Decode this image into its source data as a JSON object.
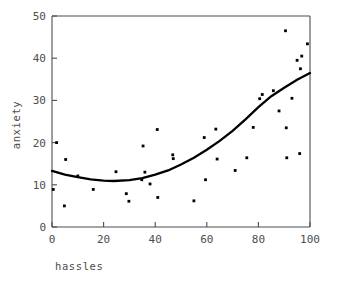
{
  "figure": {
    "background_color": "#ffffff",
    "axis_color": "#4d4d4d",
    "curve_color": "#000000",
    "point_color": "#000000"
  },
  "axes": {
    "x_title": "hassles",
    "y_title": "anxiety",
    "x_ticks": [
      "0",
      "20",
      "40",
      "60",
      "80",
      "100"
    ],
    "y_ticks": [
      "0",
      "10",
      "20",
      "30",
      "40",
      "50"
    ]
  },
  "chart_data": {
    "type": "scatter",
    "title": "",
    "xlabel": "hassles",
    "ylabel": "anxiety",
    "xlim": [
      0,
      100
    ],
    "ylim": [
      0,
      50
    ],
    "xticks": [
      0,
      20,
      40,
      60,
      80,
      100
    ],
    "yticks": [
      0,
      10,
      20,
      30,
      40,
      50
    ],
    "grid": false,
    "legend": "none",
    "series": [
      {
        "name": "observations",
        "type": "scatter",
        "marker": "square",
        "points": [
          [
            0.5,
            8.9
          ],
          [
            1.8,
            20.0
          ],
          [
            4.8,
            5.0
          ],
          [
            5.3,
            16.0
          ],
          [
            10.0,
            12.1
          ],
          [
            16.0,
            8.9
          ],
          [
            24.8,
            13.1
          ],
          [
            28.8,
            7.9
          ],
          [
            29.8,
            6.1
          ],
          [
            34.8,
            11.2
          ],
          [
            35.3,
            19.2
          ],
          [
            36.0,
            13.0
          ],
          [
            38.0,
            10.2
          ],
          [
            40.8,
            23.1
          ],
          [
            41.0,
            7.0
          ],
          [
            46.8,
            17.1
          ],
          [
            47.0,
            16.2
          ],
          [
            55.0,
            6.2
          ],
          [
            59.0,
            21.2
          ],
          [
            59.5,
            11.2
          ],
          [
            63.5,
            23.2
          ],
          [
            64.0,
            16.1
          ],
          [
            71.0,
            13.4
          ],
          [
            75.5,
            16.4
          ],
          [
            78.0,
            23.6
          ],
          [
            80.5,
            30.4
          ],
          [
            81.5,
            31.4
          ],
          [
            85.8,
            32.3
          ],
          [
            88.0,
            27.5
          ],
          [
            90.5,
            46.5
          ],
          [
            90.8,
            23.5
          ],
          [
            91.0,
            16.4
          ],
          [
            93.0,
            30.5
          ],
          [
            95.0,
            39.5
          ],
          [
            96.0,
            17.4
          ],
          [
            96.3,
            37.5
          ],
          [
            96.8,
            40.5
          ],
          [
            99.0,
            43.4
          ]
        ]
      },
      {
        "name": "quadratic fit",
        "type": "line",
        "curve_points": [
          [
            0,
            13.3
          ],
          [
            5,
            12.4
          ],
          [
            10,
            11.8
          ],
          [
            15,
            11.3
          ],
          [
            20,
            11.0
          ],
          [
            24,
            10.9
          ],
          [
            30,
            11.1
          ],
          [
            35,
            11.6
          ],
          [
            40,
            12.4
          ],
          [
            45,
            13.4
          ],
          [
            50,
            14.8
          ],
          [
            55,
            16.4
          ],
          [
            60,
            18.3
          ],
          [
            65,
            20.4
          ],
          [
            70,
            22.8
          ],
          [
            75,
            25.5
          ],
          [
            80,
            28.4
          ],
          [
            85,
            31.0
          ],
          [
            90,
            33.0
          ],
          [
            95,
            34.9
          ],
          [
            100,
            36.5
          ]
        ]
      }
    ]
  }
}
